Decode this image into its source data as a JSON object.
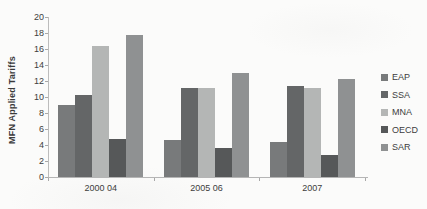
{
  "chart_data": {
    "type": "bar",
    "title": "",
    "ylabel": "MFN Applied Tariffs",
    "xlabel": "",
    "ylim": [
      0,
      20
    ],
    "ytick_step": 2,
    "grid": false,
    "legend_position": "right",
    "categories": [
      "2000 04",
      "2005 06",
      "2007"
    ],
    "series": [
      {
        "name": "EAP",
        "color": "#787a7b",
        "values": [
          9.0,
          4.6,
          4.4
        ]
      },
      {
        "name": "SSA",
        "color": "#646667",
        "values": [
          10.3,
          11.1,
          11.4
        ]
      },
      {
        "name": "MNA",
        "color": "#b4b6b5",
        "values": [
          16.4,
          11.1,
          11.1
        ]
      },
      {
        "name": "OECD",
        "color": "#565859",
        "values": [
          4.8,
          3.6,
          2.8
        ]
      },
      {
        "name": "SAR",
        "color": "#8f9192",
        "values": [
          17.8,
          13.0,
          12.2
        ]
      }
    ]
  }
}
